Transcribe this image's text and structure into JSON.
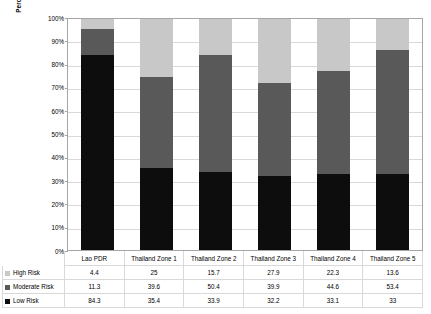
{
  "chart_data": {
    "type": "bar",
    "stacked": true,
    "normalized_percent": true,
    "title": "",
    "xlabel": "",
    "ylabel": "Percentage of households surveyed",
    "ylim": [
      0,
      100
    ],
    "ytick_labels": [
      "100%",
      "90%",
      "80%",
      "70%",
      "60%",
      "50%",
      "40%",
      "30%",
      "20%",
      "10%",
      "0%"
    ],
    "ytick_values": [
      100,
      90,
      80,
      70,
      60,
      50,
      40,
      30,
      20,
      10,
      0
    ],
    "grid": true,
    "legend_position": "bottom-table",
    "categories": [
      "Lao PDR",
      "Thailand Zone 1",
      "Thailand Zone 2",
      "Thailand Zone 3",
      "Thailand Zone 4",
      "Thailand Zone 5"
    ],
    "series": [
      {
        "name": "High Risk",
        "color": "#c8c8c8",
        "values": [
          4.4,
          25,
          15.7,
          27.9,
          22.3,
          13.6
        ],
        "labels": [
          "4.4",
          "25",
          "15.7",
          "27.9",
          "22.3",
          "13.6"
        ]
      },
      {
        "name": "Moderate Risk",
        "color": "#595959",
        "values": [
          11.3,
          39.6,
          50.4,
          39.9,
          44.6,
          53.4
        ],
        "labels": [
          "11.3",
          "39.6",
          "50.4",
          "39.9",
          "44.6",
          "53.4"
        ]
      },
      {
        "name": "Low Risk",
        "color": "#0d0d0d",
        "values": [
          84.3,
          35.4,
          33.9,
          32.2,
          33.1,
          33
        ],
        "labels": [
          "84.3",
          "35.4",
          "33.9",
          "32.2",
          "33.1",
          "33"
        ]
      }
    ],
    "stack_order_bottom_to_top": [
      "Low Risk",
      "Moderate Risk",
      "High Risk"
    ]
  },
  "table": {
    "corner_label": "",
    "column_headers": [
      "Lao PDR",
      "Thailand Zone 1",
      "Thailand Zone 2",
      "Thailand Zone 3",
      "Thailand Zone 4",
      "Thailand Zone 5"
    ],
    "rows": [
      {
        "label": "High Risk",
        "color": "#c8c8c8",
        "values": [
          "4.4",
          "25",
          "15.7",
          "27.9",
          "22.3",
          "13.6"
        ]
      },
      {
        "label": "Moderate Risk",
        "color": "#595959",
        "values": [
          "11.3",
          "39.6",
          "50.4",
          "39.9",
          "44.6",
          "53.4"
        ]
      },
      {
        "label": "Low Risk",
        "color": "#0d0d0d",
        "values": [
          "84.3",
          "35.4",
          "33.9",
          "32.2",
          "33.1",
          "33"
        ]
      }
    ]
  },
  "colors": {
    "high_risk": "#c8c8c8",
    "moderate_risk": "#595959",
    "low_risk": "#0d0d0d",
    "gridline": "#d9d9d9",
    "axis": "#a6a6a6",
    "background": "#ffffff"
  }
}
